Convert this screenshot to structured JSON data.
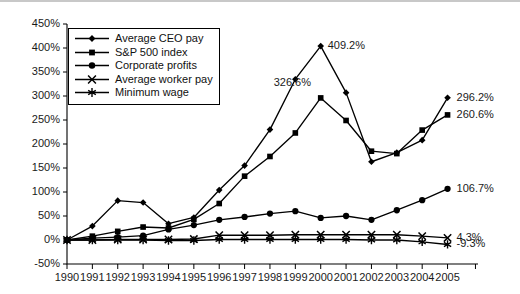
{
  "chart_data": {
    "type": "line",
    "title": "",
    "subtitle": "",
    "xlabel": "",
    "ylabel": "",
    "xlim": [
      1990,
      2006.2
    ],
    "ylim": [
      -50,
      450
    ],
    "grid": false,
    "legend_position": "upper-left-inside",
    "x": [
      1990,
      1991,
      1992,
      1993,
      1994,
      1995,
      1996,
      1997,
      1998,
      1999,
      2000,
      2001,
      2002,
      2003,
      2004,
      2005
    ],
    "categories": [
      "1990",
      "1991",
      "1992",
      "1993",
      "1994",
      "1995",
      "1996",
      "1997",
      "1998",
      "1999",
      "2000",
      "2001",
      "2002",
      "2003",
      "2004",
      "2005"
    ],
    "ytick_labels": [
      "450%",
      "400%",
      "350%",
      "300%",
      "250%",
      "200%",
      "150%",
      "100%",
      "50%",
      "0%",
      "-50%"
    ],
    "ytick_values": [
      450,
      400,
      350,
      300,
      250,
      200,
      150,
      100,
      50,
      0,
      -50
    ],
    "series": [
      {
        "name": "Average CEO pay",
        "marker": "diamond",
        "end_label": "296.2%",
        "values": [
          0,
          29,
          82,
          78,
          34,
          47,
          104,
          155,
          230,
          335,
          404,
          307,
          163,
          182,
          208,
          296.2
        ],
        "annotations": [
          {
            "x": 2000,
            "y": 409.2,
            "text": "409.2%"
          }
        ]
      },
      {
        "name": "S&P 500 index",
        "marker": "square",
        "end_label": "260.6%",
        "values": [
          0,
          8,
          18,
          27,
          25,
          43,
          76,
          133,
          174,
          223,
          296,
          249,
          185,
          180,
          229,
          260.6
        ],
        "annotations": [
          {
            "x": 2000,
            "y": 326.6,
            "text": "326.6%"
          }
        ]
      },
      {
        "name": "Corporate profits",
        "marker": "circle",
        "end_label": "106.7%",
        "values": [
          0,
          4,
          6,
          9,
          22,
          31,
          42,
          48,
          55,
          60,
          46,
          50,
          42,
          62,
          83,
          106.7
        ],
        "annotations": []
      },
      {
        "name": "Average worker pay",
        "marker": "x-cross",
        "end_label": "4.3%",
        "values": [
          0,
          0,
          1,
          1,
          1,
          2,
          10,
          10,
          10,
          11,
          11,
          11,
          11,
          11,
          8,
          4.3
        ],
        "annotations": []
      },
      {
        "name": "Minimum wage",
        "marker": "asterisk",
        "end_label": "-9.3%",
        "values": [
          0,
          0,
          0,
          0,
          -1,
          -1,
          1,
          1,
          1,
          1,
          1,
          1,
          0,
          0,
          -4,
          -9.3
        ],
        "annotations": []
      }
    ],
    "annotation_texts": [
      "409.2%",
      "326.6%"
    ],
    "end_labels": [
      "296.2%",
      "260.6%",
      "106.7%",
      "4.3%",
      "-9.3%"
    ],
    "colors": {
      "line": "#000000",
      "marker": "#000000",
      "axis": "#000000",
      "text": "#1a1a1a",
      "background": "#ffffff",
      "frame": "#c8c8c8"
    }
  }
}
